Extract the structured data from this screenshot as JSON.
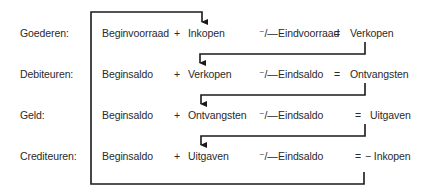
{
  "diagram": {
    "title": "",
    "rows": [
      {
        "label": "Goederen:",
        "begin": "Beginvoorraad",
        "plus": "+",
        "term": "Inkopen",
        "minus": "⁻/—",
        "end": "Eindvoorraad",
        "eq": "=",
        "result": "Verkopen"
      },
      {
        "label": "Debiteuren:",
        "begin": "Beginsaldo",
        "plus": "+",
        "term": "Verkopen",
        "minus": "⁻/—",
        "end": "Eindsaldo",
        "eq": "=",
        "result": "Ontvangsten"
      },
      {
        "label": "Geld:",
        "begin": "Beginsaldo",
        "plus": "+",
        "term": "Ontvangsten",
        "minus": "⁻/—",
        "end": "Eindsaldo",
        "eq": "=",
        "result": "Uitgaven"
      },
      {
        "label": "Crediteuren:",
        "begin": "Beginsaldo",
        "plus": "+",
        "term": "Uitgaven",
        "minus": "⁻/—",
        "end": "Eindsaldo",
        "eq": "=",
        "result": "− Inkopen"
      }
    ],
    "connections": [
      {
        "from": "Crediteuren: − Inkopen",
        "to": "Goederen: Inkopen"
      },
      {
        "from": "Goederen: Verkopen",
        "to": "Debiteuren: Verkopen"
      },
      {
        "from": "Debiteuren: Ontvangsten",
        "to": "Geld: Ontvangsten"
      },
      {
        "from": "Geld: Uitgaven",
        "to": "Crediteuren: Uitgaven"
      }
    ],
    "colors": {
      "line": "#1a1a1a",
      "text": "#2a2a2a",
      "background": "#ffffff"
    }
  }
}
